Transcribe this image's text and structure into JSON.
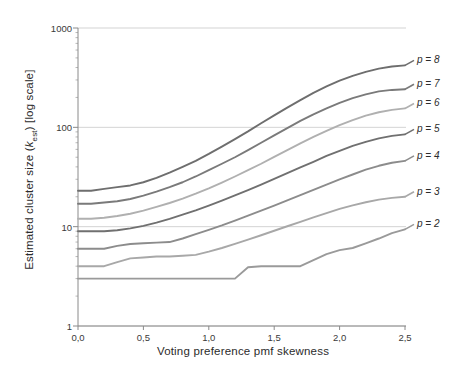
{
  "chart_data": {
    "type": "line",
    "title": "",
    "xlabel": "Voting preference  pmf skewness",
    "ylabel": "Estimated cluster size (kest) [log scale]",
    "ylabel_main": "Estimated cluster size (",
    "ylabel_var": "k",
    "ylabel_sub": "est",
    "ylabel_tail": ") [log scale]",
    "yscale": "log",
    "xlim": [
      0.0,
      2.5
    ],
    "ylim": [
      1,
      1000
    ],
    "grid": true,
    "grid_axis": "y",
    "legend_position": "right-outside",
    "xticks": [
      0.0,
      0.5,
      1.0,
      1.5,
      2.0,
      2.5
    ],
    "xticklabels": [
      "0,0",
      "0,5",
      "1,0",
      "1,5",
      "2,0",
      "2,5"
    ],
    "yticks": [
      1,
      10,
      100,
      1000
    ],
    "yticklabels": [
      "1",
      "10",
      "100",
      "1000"
    ],
    "x": [
      0.0,
      0.1,
      0.2,
      0.3,
      0.4,
      0.5,
      0.6,
      0.7,
      0.8,
      0.9,
      1.0,
      1.1,
      1.2,
      1.3,
      1.4,
      1.5,
      1.6,
      1.7,
      1.8,
      1.9,
      2.0,
      2.1,
      2.2,
      2.3,
      2.4,
      2.5
    ],
    "series": [
      {
        "name": "p = 8",
        "label": "p = 8",
        "color": "#6e6e6e",
        "values": [
          23,
          23,
          24,
          25,
          26,
          28,
          31,
          35,
          40,
          46,
          54,
          64,
          76,
          91,
          110,
          132,
          158,
          188,
          222,
          258,
          295,
          330,
          362,
          390,
          410,
          420
        ]
      },
      {
        "name": "p = 7",
        "label": "p = 7",
        "color": "#7a7a7a",
        "values": [
          17,
          17,
          17.5,
          18,
          19,
          20.5,
          22.5,
          25,
          28,
          32,
          37,
          43,
          50,
          59,
          70,
          83,
          98,
          116,
          135,
          155,
          176,
          197,
          215,
          230,
          238,
          242
        ]
      },
      {
        "name": "p = 6",
        "label": "p = 6",
        "color": "#b0b0b0",
        "values": [
          12,
          12,
          12.3,
          12.8,
          13.5,
          14.5,
          15.8,
          17.3,
          19.2,
          21.5,
          24.3,
          27.8,
          32,
          37,
          43,
          50.5,
          59,
          69,
          80,
          92,
          105,
          118,
          131,
          142,
          150,
          155
        ]
      },
      {
        "name": "p = 5",
        "label": "p = 5",
        "color": "#707070",
        "values": [
          9,
          9,
          9,
          9.2,
          9.6,
          10.2,
          11,
          12,
          13.2,
          14.6,
          16.3,
          18.3,
          20.6,
          23.3,
          26.5,
          30.2,
          34.5,
          39.5,
          45,
          51.5,
          58,
          65,
          71.5,
          77.5,
          82,
          85
        ]
      },
      {
        "name": "p = 4",
        "label": "p = 4",
        "color": "#8c8c8c",
        "values": [
          6,
          6,
          6,
          6.4,
          6.7,
          6.8,
          6.9,
          7,
          7.6,
          8.4,
          9.3,
          10.3,
          11.5,
          12.9,
          14.5,
          16.3,
          18.4,
          20.8,
          23.5,
          26.5,
          30,
          33.5,
          37.5,
          41,
          44,
          46
        ]
      },
      {
        "name": "p = 3",
        "label": "p = 3",
        "color": "#a8a8a8",
        "values": [
          4,
          4,
          4,
          4.4,
          4.8,
          4.9,
          5,
          5,
          5.1,
          5.2,
          5.6,
          6.1,
          6.7,
          7.4,
          8.2,
          9.1,
          10.1,
          11.2,
          12.4,
          13.7,
          15.1,
          16.4,
          17.6,
          18.7,
          19.5,
          20
        ]
      },
      {
        "name": "p = 2",
        "label": "p = 2",
        "color": "#9a9a9a",
        "values": [
          3,
          3,
          3,
          3,
          3,
          3,
          3,
          3,
          3,
          3,
          3,
          3,
          3,
          3.9,
          4,
          4,
          4,
          4,
          4.6,
          5.3,
          5.8,
          6.1,
          6.8,
          7.6,
          8.6,
          9.4
        ]
      }
    ],
    "legend_entries": [
      {
        "label": "p = 8",
        "y_value": 420
      },
      {
        "label": "p = 7",
        "y_value": 242
      },
      {
        "label": "p = 6",
        "y_value": 155
      },
      {
        "label": "p = 5",
        "y_value": 85
      },
      {
        "label": "p = 4",
        "y_value": 46
      },
      {
        "label": "p = 3",
        "y_value": 20
      },
      {
        "label": "p = 2",
        "y_value": 9.4
      }
    ],
    "colors": {
      "axis": "#8a8a8a",
      "grid": "#c8c8c8",
      "text": "#2b2b2b",
      "background": "#ffffff"
    }
  }
}
